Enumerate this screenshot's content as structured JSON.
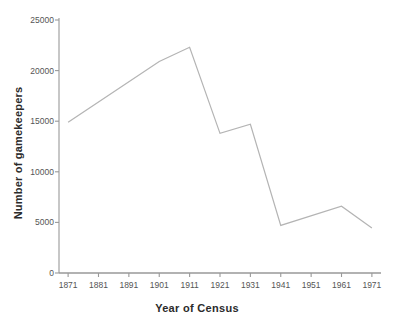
{
  "chart_data": {
    "type": "line",
    "title": "",
    "subtitle": "",
    "xlabel": "Year of Census",
    "ylabel": "Number of gamekeepers",
    "categories": [
      "1871",
      "1881",
      "1891",
      "1901",
      "1911",
      "1921",
      "1931",
      "1941",
      "1951",
      "1961",
      "1971"
    ],
    "x": [
      1871,
      1881,
      1891,
      1901,
      1911,
      1921,
      1931,
      1941,
      1951,
      1961,
      1971
    ],
    "values": [
      14900,
      null,
      null,
      20900,
      22300,
      13800,
      14700,
      4700,
      null,
      6600,
      4450
    ],
    "series": [
      {
        "name": "Number of gamekeepers",
        "points": [
          {
            "x": 1871,
            "y": 14900
          },
          {
            "x": 1901,
            "y": 20900
          },
          {
            "x": 1911,
            "y": 22300
          },
          {
            "x": 1921,
            "y": 13800
          },
          {
            "x": 1931,
            "y": 14700
          },
          {
            "x": 1941,
            "y": 4700
          },
          {
            "x": 1961,
            "y": 6600
          },
          {
            "x": 1971,
            "y": 4450
          }
        ],
        "color": "#b4b4b4"
      }
    ],
    "ylim": [
      0,
      25000
    ],
    "xlim": [
      1868,
      1974
    ],
    "yticks": [
      0,
      5000,
      10000,
      15000,
      20000,
      25000
    ],
    "ytick_labels": [
      "0",
      "5000",
      "10000",
      "15000",
      "20000",
      "25000"
    ],
    "xticks": [
      1871,
      1881,
      1891,
      1901,
      1911,
      1921,
      1931,
      1941,
      1951,
      1961,
      1971
    ],
    "grid": false,
    "legend": "none",
    "axis_color": "#999999",
    "text_color": "#555555",
    "title_color": "#2b2b2b",
    "background": "#ffffff"
  }
}
